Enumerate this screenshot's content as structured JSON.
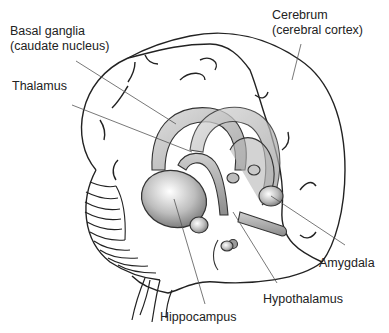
{
  "diagram": {
    "labels": {
      "basal_ganglia": {
        "line1": "Basal ganglia",
        "line2": "(caudate nucleus)"
      },
      "thalamus": {
        "line1": "Thalamus"
      },
      "cerebrum": {
        "line1": "Cerebrum",
        "line2": "(cerebral cortex)"
      },
      "amygdala": {
        "line1": "Amygdala"
      },
      "hypothalamus": {
        "line1": "Hypothalamus"
      },
      "hippocampus": {
        "line1": "Hippocampus"
      }
    },
    "colors": {
      "outline": "#222222",
      "leader_line": "#555555",
      "structure_light": "#f2f2f2",
      "structure_dark": "#8a8a8a"
    }
  }
}
